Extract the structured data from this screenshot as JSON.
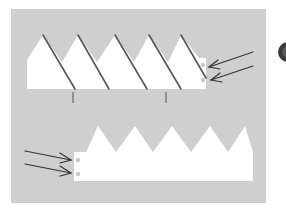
{
  "diagram": {
    "title": "",
    "colors": {
      "page": "#ffffff",
      "panel": "#cfcfcf",
      "strip": "#ffffff",
      "fold_line": "#555555",
      "arrow": "#333333",
      "hole": "#c8c8c8",
      "badge": "#3a3a3a"
    },
    "top_strip": {
      "peaks": 5,
      "fold_lines": 5,
      "tick_marks": 2,
      "holes": 2,
      "arrows": 2
    },
    "bottom_strip": {
      "peaks": 5,
      "holes": 2,
      "arrows": 2
    },
    "badge": "partially visible dark circle icon at right edge"
  }
}
